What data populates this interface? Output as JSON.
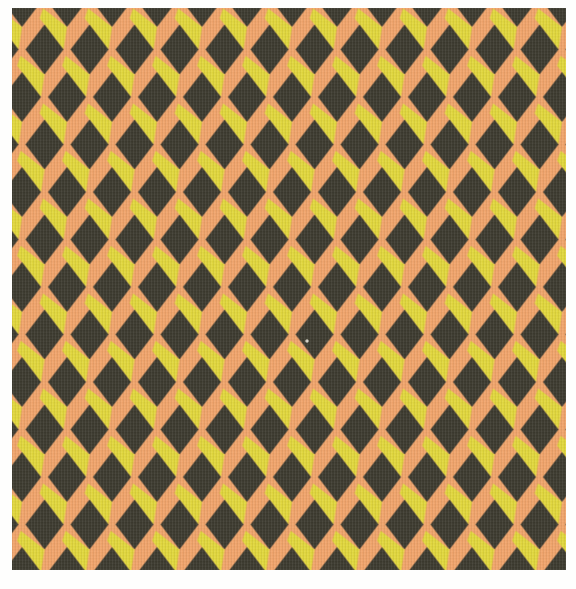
{
  "colors": {
    "page_background": "#fefefd",
    "diamond_dark": "#3c3a2f",
    "stripe_yellow": "#e1d73c",
    "stripe_orange": "#f1a46b",
    "defect_speck": "#e9e5da"
  },
  "pattern": {
    "motif": "diamond and chevron zigzag",
    "column_pitch_px": 45,
    "row_pitch_px": 47.5,
    "diamond_width_px": 38,
    "diamond_height_px": 50,
    "stripe_thickness_px": 17,
    "yellow_stripe_direction": "descending left-to-right",
    "orange_stripe_direction": "ascending left-to-right"
  },
  "defect": {
    "x": 295,
    "y": 333,
    "radius": 1.7
  }
}
